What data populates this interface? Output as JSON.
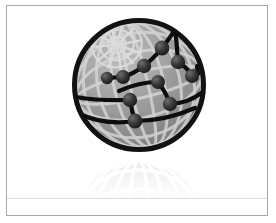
{
  "image": {
    "title": "Network Globe Icon",
    "subject": "wireframe-globe-with-network-overlay",
    "width": 276,
    "height": 223,
    "background_color": "#ffffff",
    "alt_text": "Grayscale wireframe globe with a black node-and-link network overlay and a faded reflection below"
  },
  "frame": {
    "name": "image-border",
    "color": "#a8a8a8",
    "thickness_px": 1,
    "inset_left": 6,
    "inset_top": 5,
    "width": 262,
    "height": 211
  },
  "floor": {
    "name": "reflection-floor-line",
    "color": "#dcdcdc",
    "y": 198
  },
  "globe": {
    "name": "globe",
    "center_x": 139,
    "center_y": 85,
    "radius": 66,
    "outline_color": "#111111",
    "outline_width": 5,
    "fill_light": "#b4b4b4",
    "fill_mid": "#969696",
    "fill_dark": "#7a7a7a",
    "grid_color": "#d4d4d4",
    "grid_width": 3,
    "meridian_count": 7,
    "parallel_count": 4,
    "polar_spokes": 12
  },
  "network": {
    "name": "network-overlay",
    "node_color": "#2b2b2b",
    "node_highlight": "#6a6a6a",
    "link_color": "#0d0d0d",
    "link_width": 4,
    "node_radius": 6.5,
    "node_count": 10,
    "link_count": 11,
    "nodes": [
      {
        "id": "n1",
        "x": 123,
        "y": 77,
        "label": "node-1"
      },
      {
        "id": "n2",
        "x": 144,
        "y": 66,
        "label": "node-2"
      },
      {
        "id": "n3",
        "x": 162,
        "y": 48,
        "label": "node-3"
      },
      {
        "id": "n4",
        "x": 178,
        "y": 62,
        "label": "node-4"
      },
      {
        "id": "n5",
        "x": 158,
        "y": 82,
        "label": "node-5"
      },
      {
        "id": "n6",
        "x": 191,
        "y": 76,
        "label": "node-6"
      },
      {
        "id": "n7",
        "x": 130,
        "y": 100,
        "label": "node-7"
      },
      {
        "id": "n8",
        "x": 170,
        "y": 104,
        "label": "node-8"
      },
      {
        "id": "n9",
        "x": 135,
        "y": 121,
        "label": "node-9"
      },
      {
        "id": "n10",
        "x": 107,
        "y": 78,
        "label": "node-10-terminal"
      }
    ],
    "links": [
      {
        "from": "n10",
        "to": "n1"
      },
      {
        "from": "n1",
        "to": "n2"
      },
      {
        "from": "n2",
        "to": "n3"
      },
      {
        "from": "n3",
        "to": "n4"
      },
      {
        "from": "n4",
        "to": "n6"
      },
      {
        "from": "n5",
        "to": "n8"
      },
      {
        "from": "n7",
        "to": "n9"
      },
      {
        "from": "n8",
        "to": "n6"
      },
      {
        "from": "n3",
        "to": "n-top-arc"
      },
      {
        "from": "n7",
        "to": "n-left-arc"
      },
      {
        "from": "n9",
        "to": "n-bottom-arc"
      }
    ]
  },
  "reflection": {
    "name": "globe-reflection",
    "opacity": 0.22,
    "top_y": 157,
    "height": 42,
    "fade": "top-to-bottom"
  }
}
